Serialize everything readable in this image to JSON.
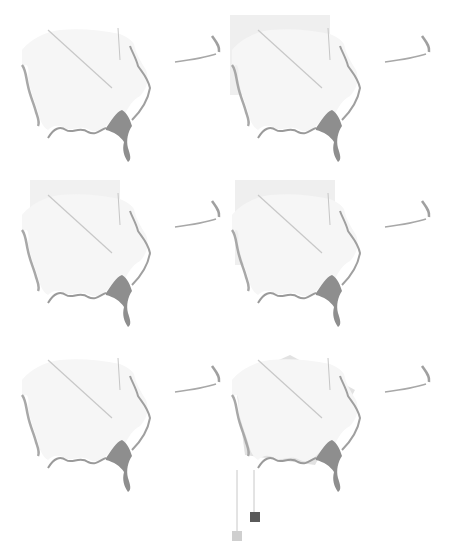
{
  "figure": {
    "layout": "3 rows x 2 columns small-multiple maps",
    "colors": {
      "background": "#ffffff",
      "outline": "#9a9a9a",
      "light_fill": "#d8d8d8",
      "mid_fill": "#bdbdbd",
      "dark_fill": "#8e8e8e"
    },
    "panels": [
      {
        "id": "r1c1",
        "row": 1,
        "col": 1,
        "intensity": 0.1
      },
      {
        "id": "r1c2",
        "row": 1,
        "col": 2,
        "intensity": 0.55
      },
      {
        "id": "r2c1",
        "row": 2,
        "col": 1,
        "intensity": 0.35
      },
      {
        "id": "r2c2",
        "row": 2,
        "col": 2,
        "intensity": 0.4
      },
      {
        "id": "r3c1",
        "row": 3,
        "col": 1,
        "intensity": 0.6
      },
      {
        "id": "r3c2",
        "row": 3,
        "col": 2,
        "intensity": 0.7
      }
    ]
  },
  "legend": {
    "items": [
      {
        "swatch": "light",
        "color": "#cfcfcf"
      },
      {
        "swatch": "dark",
        "color": "#5a5a5a"
      }
    ]
  }
}
